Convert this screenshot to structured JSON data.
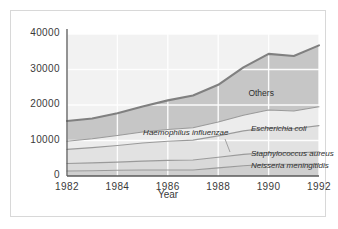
{
  "chart_data": {
    "type": "area",
    "stacked": true,
    "title": "",
    "xlabel": "Year",
    "ylabel": "",
    "x": [
      1982,
      1983,
      1984,
      1985,
      1986,
      1987,
      1988,
      1989,
      1990,
      1991,
      1992
    ],
    "xticks": [
      "1982",
      "1984",
      "1986",
      "1988",
      "1990",
      "1992"
    ],
    "xtick_values": [
      1982,
      1984,
      1986,
      1988,
      1990,
      1992
    ],
    "yticks": [
      "0",
      "10000",
      "20000",
      "30000",
      "40000"
    ],
    "ytick_values": [
      0,
      10000,
      20000,
      30000,
      40000
    ],
    "xlim": [
      1982,
      1992
    ],
    "ylim": [
      0,
      40000
    ],
    "grid": true,
    "grid_color": "#ffffff",
    "legend": "inline-labels",
    "series": [
      {
        "name": "Neisseria meningitidis",
        "label": "Neisseria meningitidis",
        "fill": "#cfcfcf",
        "line": "#9a9a9a",
        "values": [
          1400,
          1500,
          1600,
          1700,
          1700,
          1700,
          2300,
          2900,
          3300,
          3300,
          3400
        ]
      },
      {
        "name": "Staphylococcus aureus",
        "label": "Staphylococcus aureus",
        "fill": "#d9d9d9",
        "line": "#9a9a9a",
        "values": [
          2100,
          2200,
          2300,
          2500,
          2700,
          2800,
          3000,
          3200,
          3300,
          3200,
          3400
        ]
      },
      {
        "name": "Escherichia coli",
        "label": "Escherichia coli",
        "fill": "#e2e2e2",
        "line": "#9a9a9a",
        "values": [
          4000,
          4300,
          4700,
          5100,
          5400,
          5600,
          6000,
          6600,
          7000,
          6800,
          7400
        ]
      },
      {
        "name": "Haemophilus influenzae",
        "label": "Haemophilus influenzae",
        "fill": "#ececec",
        "line": "#9a9a9a",
        "values": [
          2300,
          2500,
          2800,
          3100,
          3300,
          3500,
          3900,
          4400,
          5000,
          5000,
          5300
        ]
      },
      {
        "name": "Others",
        "label": "Others",
        "fill": "#c6c6c6",
        "line": "#7d7d7d",
        "values": [
          5700,
          5700,
          6300,
          7200,
          8200,
          9100,
          10500,
          13500,
          15800,
          15500,
          17300
        ]
      }
    ],
    "totals": [
      15500,
      16200,
      17700,
      19600,
      21300,
      22700,
      25700,
      30600,
      34400,
      33800,
      36800
    ],
    "colors": {
      "top_line": "#808080",
      "axis": "#5a5a5a",
      "plot_bg": "#f2f2f2",
      "frame": "#d8d8d8",
      "text": "#3a3a3a"
    },
    "label_positions": {
      "Others": {
        "x": 1989.2,
        "y": 23500
      },
      "Escherichia coli": {
        "x": 1989.3,
        "y": 13200
      },
      "Haemophilus influenzae": {
        "x": 1985.1,
        "y": 12100
      },
      "Staphylococcus aureus": {
        "x": 1989.3,
        "y": 6200
      },
      "Neisseria meningitidis": {
        "x": 1989.3,
        "y": 2800
      }
    }
  }
}
